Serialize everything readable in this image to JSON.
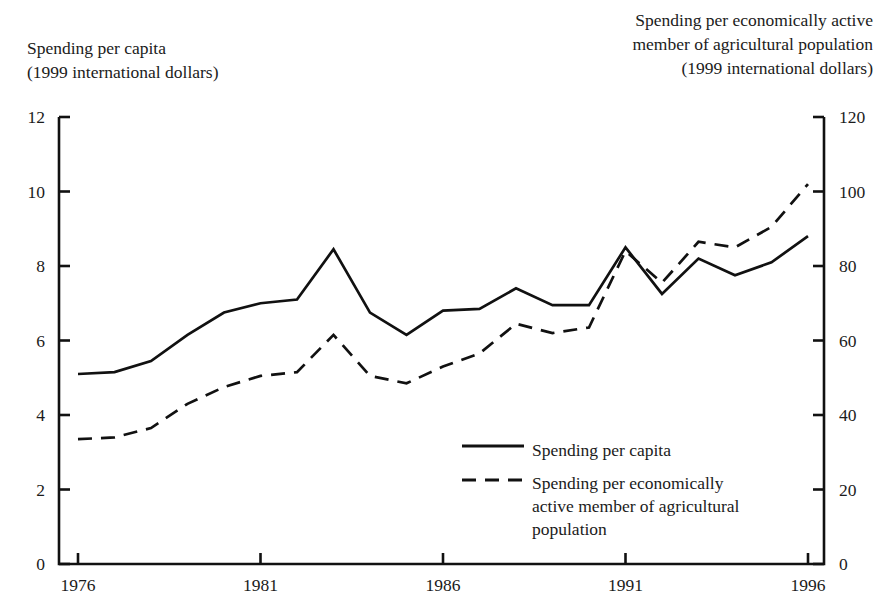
{
  "chart_data": {
    "type": "line",
    "title": "",
    "xlabel": "",
    "ylabel": "Spending per capita (1999 international dollars)",
    "y2label": "Spending per economically active member of agricultural population (1999 international dollars)",
    "grid": false,
    "legend_position": "center-right-inside",
    "x": [
      1976,
      1977,
      1978,
      1979,
      1980,
      1981,
      1982,
      1983,
      1984,
      1985,
      1986,
      1987,
      1988,
      1989,
      1990,
      1991,
      1992,
      1993,
      1994,
      1995,
      1996
    ],
    "xlim": [
      1976,
      1996
    ],
    "xticks": [
      1976,
      1981,
      1986,
      1991,
      1996
    ],
    "xtick_labels": [
      "1976",
      "1981",
      "1986",
      "1991",
      "1996"
    ],
    "ylim": [
      0,
      12
    ],
    "yticks": [
      0,
      2,
      4,
      6,
      8,
      10,
      12
    ],
    "ytick_labels": [
      "0",
      "2",
      "4",
      "6",
      "8",
      "10",
      "12"
    ],
    "y2lim": [
      0,
      120
    ],
    "y2ticks": [
      0,
      20,
      40,
      60,
      80,
      100,
      120
    ],
    "y2tick_labels": [
      "0",
      "20",
      "40",
      "60",
      "80",
      "100",
      "120"
    ],
    "series": [
      {
        "name": "Spending per capita",
        "axis": "left",
        "style": "solid",
        "color": "#111111",
        "values": [
          5.1,
          5.15,
          5.45,
          6.15,
          6.75,
          7.0,
          7.1,
          8.45,
          6.75,
          6.15,
          6.8,
          6.85,
          7.4,
          6.95,
          6.95,
          8.5,
          7.25,
          8.2,
          7.75,
          8.1,
          8.8
        ]
      },
      {
        "name": "Spending per economically active member of agricultural population",
        "axis": "right",
        "style": "dashed",
        "color": "#111111",
        "values": [
          33.5,
          34.0,
          36.5,
          43.0,
          47.5,
          50.5,
          51.5,
          61.5,
          50.5,
          48.5,
          53.0,
          56.5,
          64.5,
          62.0,
          63.5,
          84.0,
          75.5,
          86.5,
          85.0,
          90.5,
          102.0
        ]
      }
    ]
  },
  "legend": {
    "items": [
      {
        "label": "Spending per capita",
        "style": "solid"
      },
      {
        "label": "Spending per economically\nactive member of agricultural\npopulation",
        "style": "dashed"
      }
    ]
  },
  "axis_titles": {
    "left": "Spending per capita\n(1999 international dollars)",
    "right": "Spending per economically active\nmember of agricultural population\n(1999 international dollars)"
  }
}
